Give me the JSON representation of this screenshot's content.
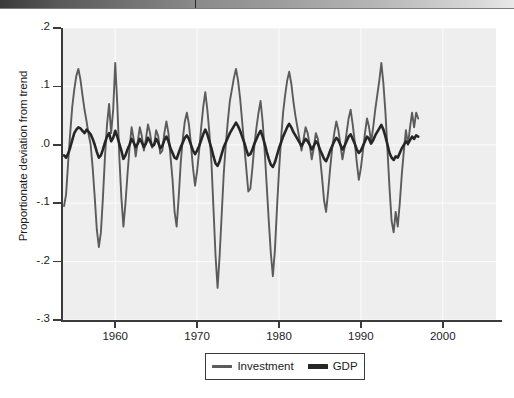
{
  "figure": {
    "background": "#ffffff",
    "panel_background": "#eeeeee",
    "axis_color": "#3b3b3b"
  },
  "axes": {
    "ylabel": "Proportionate deviation from trend",
    "yticks": [
      ".2",
      ".1",
      ".0",
      "-.1",
      "-.2",
      "-.3"
    ],
    "xticks": [
      "1960",
      "1970",
      "1980",
      "1990",
      "2000"
    ]
  },
  "legend": {
    "items": [
      {
        "label": "Investment",
        "color": "#5b5b5b"
      },
      {
        "label": "GDP",
        "color": "#262626"
      }
    ]
  },
  "chart_data": {
    "type": "line",
    "title": "",
    "xlabel": "",
    "ylabel": "Proportionate deviation from trend",
    "xlim": [
      1953.5,
      2006.5
    ],
    "ylim": [
      -0.3,
      0.2
    ],
    "ytick_values": [
      0.2,
      0.1,
      0.0,
      -0.1,
      -0.2,
      -0.3
    ],
    "xtick_values": [
      1960,
      1970,
      1980,
      1990,
      2000
    ],
    "grid": "faint-white-gridlines",
    "legend_position": "below-axes-center",
    "x_step": 0.25,
    "series": [
      {
        "name": "Investment",
        "color": "#5b5b5b",
        "x_start": 1953.75,
        "values": [
          -0.105,
          -0.085,
          -0.03,
          0.02,
          0.065,
          0.095,
          0.118,
          0.13,
          0.112,
          0.085,
          0.06,
          0.04,
          0.018,
          0.0,
          -0.04,
          -0.09,
          -0.145,
          -0.175,
          -0.15,
          -0.09,
          -0.02,
          0.035,
          0.07,
          0.02,
          0.06,
          0.14,
          0.07,
          -0.02,
          -0.09,
          -0.14,
          -0.1,
          -0.05,
          -0.005,
          0.03,
          0.01,
          -0.02,
          0.005,
          0.03,
          0.015,
          -0.01,
          0.01,
          0.035,
          0.02,
          -0.005,
          0.0,
          0.025,
          0.015,
          -0.015,
          -0.01,
          0.02,
          0.04,
          0.02,
          -0.02,
          -0.06,
          -0.115,
          -0.14,
          -0.09,
          -0.03,
          0.01,
          0.04,
          0.055,
          0.035,
          0.0,
          -0.04,
          -0.07,
          -0.045,
          -0.01,
          0.03,
          0.065,
          0.09,
          0.06,
          0.02,
          -0.03,
          -0.11,
          -0.19,
          -0.245,
          -0.19,
          -0.12,
          -0.05,
          0.0,
          0.04,
          0.075,
          0.095,
          0.115,
          0.13,
          0.11,
          0.08,
          0.04,
          0.0,
          -0.04,
          -0.08,
          -0.075,
          -0.04,
          0.0,
          0.03,
          0.055,
          0.075,
          0.04,
          -0.01,
          -0.07,
          -0.13,
          -0.185,
          -0.225,
          -0.18,
          -0.11,
          -0.045,
          0.01,
          0.055,
          0.085,
          0.11,
          0.125,
          0.105,
          0.075,
          0.05,
          0.03,
          0.01,
          -0.01,
          0.01,
          0.03,
          0.02,
          0.0,
          -0.025,
          -0.005,
          0.02,
          0.01,
          -0.02,
          -0.055,
          -0.095,
          -0.115,
          -0.08,
          -0.04,
          -0.005,
          0.02,
          0.04,
          0.025,
          0.0,
          -0.025,
          -0.005,
          0.02,
          0.045,
          0.06,
          0.035,
          0.005,
          -0.03,
          -0.06,
          -0.04,
          -0.01,
          0.02,
          0.045,
          0.03,
          0.005,
          0.03,
          0.06,
          0.085,
          0.11,
          0.14,
          0.105,
          0.055,
          -0.01,
          -0.075,
          -0.13,
          -0.15,
          -0.115,
          -0.14,
          -0.1,
          -0.05,
          -0.01,
          0.025,
          0.0,
          0.03,
          0.055,
          0.03,
          0.055,
          0.045
        ]
      },
      {
        "name": "GDP",
        "color": "#262626",
        "x_start": 1953.75,
        "values": [
          -0.018,
          -0.022,
          -0.015,
          -0.005,
          0.008,
          0.02,
          0.026,
          0.03,
          0.028,
          0.024,
          0.02,
          0.026,
          0.022,
          0.018,
          0.01,
          0.0,
          -0.012,
          -0.022,
          -0.018,
          -0.008,
          0.004,
          0.014,
          0.02,
          0.006,
          0.012,
          0.024,
          0.014,
          0.002,
          -0.01,
          -0.024,
          -0.018,
          -0.008,
          0.0,
          0.01,
          0.004,
          -0.004,
          0.002,
          0.01,
          0.004,
          -0.004,
          0.002,
          0.012,
          0.006,
          -0.002,
          0.0,
          0.01,
          0.004,
          -0.006,
          -0.002,
          0.008,
          0.014,
          0.006,
          -0.006,
          -0.014,
          -0.022,
          -0.024,
          -0.014,
          -0.004,
          0.004,
          0.012,
          0.016,
          0.01,
          0.0,
          -0.01,
          -0.016,
          -0.01,
          -0.002,
          0.008,
          0.018,
          0.026,
          0.018,
          0.006,
          -0.006,
          -0.02,
          -0.032,
          -0.036,
          -0.028,
          -0.016,
          -0.004,
          0.004,
          0.012,
          0.02,
          0.026,
          0.032,
          0.038,
          0.032,
          0.024,
          0.014,
          0.004,
          -0.008,
          -0.018,
          -0.016,
          -0.008,
          0.002,
          0.01,
          0.018,
          0.024,
          0.014,
          0.002,
          -0.012,
          -0.024,
          -0.034,
          -0.038,
          -0.03,
          -0.018,
          -0.006,
          0.004,
          0.014,
          0.022,
          0.03,
          0.036,
          0.03,
          0.022,
          0.016,
          0.01,
          0.004,
          -0.002,
          0.004,
          0.01,
          0.006,
          0.0,
          -0.008,
          -0.002,
          0.006,
          0.002,
          -0.008,
          -0.016,
          -0.024,
          -0.028,
          -0.02,
          -0.01,
          -0.002,
          0.006,
          0.012,
          0.008,
          0.0,
          -0.008,
          -0.002,
          0.006,
          0.014,
          0.018,
          0.01,
          0.002,
          -0.008,
          -0.014,
          -0.01,
          -0.002,
          0.006,
          0.014,
          0.01,
          0.002,
          0.008,
          0.016,
          0.022,
          0.028,
          0.034,
          0.026,
          0.014,
          0.0,
          -0.014,
          -0.022,
          -0.026,
          -0.02,
          -0.022,
          -0.014,
          -0.006,
          0.0,
          0.006,
          0.002,
          0.008,
          0.014,
          0.01,
          0.016,
          0.014
        ]
      }
    ]
  }
}
